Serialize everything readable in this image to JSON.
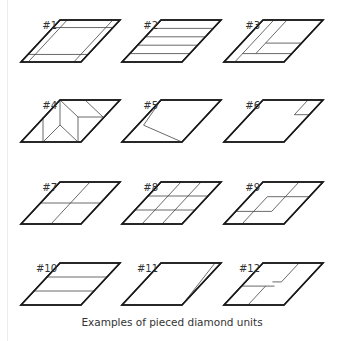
{
  "caption": "Examples of pieced diamond units",
  "units": [
    {
      "label": "#1",
      "description": "border strips on all four sides"
    },
    {
      "label": "#2",
      "description": "four horizontal strips (five rows)"
    },
    {
      "label": "#3",
      "description": "two slanted strips on left with two horizontal strips at lower right"
    },
    {
      "label": "#4",
      "description": "pieced with kite and triangle shapes"
    },
    {
      "label": "#5",
      "description": "single inset parallelogram seam"
    },
    {
      "label": "#6",
      "description": "small corner piece at upper right"
    },
    {
      "label": "#7",
      "description": "four-patch (2x2 grid)"
    },
    {
      "label": "#8",
      "description": "nine-patch (3x3 grid)"
    },
    {
      "label": "#9",
      "description": "inset center diamond with corner seams"
    },
    {
      "label": "#10",
      "description": "three horizontal strips"
    },
    {
      "label": "#11",
      "description": "one slanted seam near right edge"
    },
    {
      "label": "#12",
      "description": "two offset corner pieces"
    }
  ]
}
